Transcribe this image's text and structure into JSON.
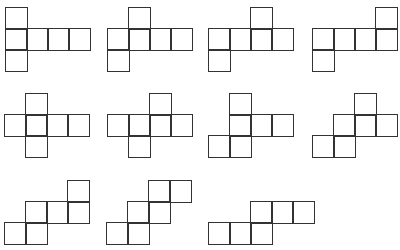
{
  "diagram": {
    "title": "",
    "cell_size": 21,
    "stroke_color": "#333333",
    "background": "#ffffff",
    "nets": [
      {
        "id": 1,
        "x": 5,
        "y": 7,
        "cells": [
          [
            0,
            0
          ],
          [
            0,
            1
          ],
          [
            1,
            1
          ],
          [
            2,
            1
          ],
          [
            3,
            1
          ],
          [
            0,
            2
          ]
        ]
      },
      {
        "id": 2,
        "x": 107,
        "y": 7,
        "cells": [
          [
            1,
            0
          ],
          [
            0,
            1
          ],
          [
            1,
            1
          ],
          [
            2,
            1
          ],
          [
            3,
            1
          ],
          [
            0,
            2
          ]
        ]
      },
      {
        "id": 3,
        "x": 208,
        "y": 7,
        "cells": [
          [
            2,
            0
          ],
          [
            0,
            1
          ],
          [
            1,
            1
          ],
          [
            2,
            1
          ],
          [
            3,
            1
          ],
          [
            0,
            2
          ]
        ]
      },
      {
        "id": 4,
        "x": 312,
        "y": 7,
        "cells": [
          [
            3,
            0
          ],
          [
            0,
            1
          ],
          [
            1,
            1
          ],
          [
            2,
            1
          ],
          [
            3,
            1
          ],
          [
            0,
            2
          ]
        ]
      },
      {
        "id": 5,
        "x": 4,
        "y": 93,
        "cells": [
          [
            1,
            0
          ],
          [
            0,
            1
          ],
          [
            1,
            1
          ],
          [
            2,
            1
          ],
          [
            3,
            1
          ],
          [
            1,
            2
          ]
        ]
      },
      {
        "id": 6,
        "x": 107,
        "y": 93,
        "cells": [
          [
            2,
            0
          ],
          [
            0,
            1
          ],
          [
            1,
            1
          ],
          [
            2,
            1
          ],
          [
            3,
            1
          ],
          [
            1,
            2
          ]
        ]
      },
      {
        "id": 7,
        "x": 208,
        "y": 93,
        "cells": [
          [
            1,
            0
          ],
          [
            1,
            1
          ],
          [
            2,
            1
          ],
          [
            3,
            1
          ],
          [
            0,
            2
          ],
          [
            1,
            2
          ]
        ]
      },
      {
        "id": 8,
        "x": 312,
        "y": 93,
        "cells": [
          [
            2,
            0
          ],
          [
            1,
            1
          ],
          [
            2,
            1
          ],
          [
            3,
            1
          ],
          [
            0,
            2
          ],
          [
            1,
            2
          ]
        ]
      },
      {
        "id": 9,
        "x": 4,
        "y": 180,
        "cells": [
          [
            3,
            0
          ],
          [
            1,
            1
          ],
          [
            2,
            1
          ],
          [
            3,
            1
          ],
          [
            0,
            2
          ],
          [
            1,
            2
          ]
        ]
      },
      {
        "id": 10,
        "x": 106,
        "y": 180,
        "cells": [
          [
            2,
            0
          ],
          [
            3,
            0
          ],
          [
            1,
            1
          ],
          [
            2,
            1
          ],
          [
            0,
            2
          ],
          [
            1,
            2
          ]
        ]
      },
      {
        "id": 11,
        "x": 208,
        "y": 180,
        "cells": [
          [
            2,
            1
          ],
          [
            3,
            1
          ],
          [
            4,
            1
          ],
          [
            0,
            2
          ],
          [
            1,
            2
          ],
          [
            2,
            2
          ]
        ]
      }
    ]
  }
}
